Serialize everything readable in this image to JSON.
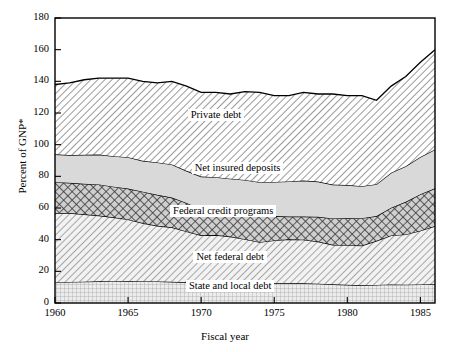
{
  "chart_data": {
    "type": "area",
    "stacked": true,
    "title": "",
    "subtitle": "",
    "xlabel": "Fiscal year",
    "ylabel": "Percent of GNP*",
    "xlim": [
      1960,
      1986
    ],
    "ylim": [
      0,
      180
    ],
    "grid": false,
    "legend_position": "inline-annotations",
    "x_ticks": [
      1960,
      1965,
      1970,
      1975,
      1980,
      1985
    ],
    "y_ticks": [
      0,
      20,
      40,
      60,
      80,
      100,
      120,
      140,
      160,
      180
    ],
    "x": [
      1960,
      1961,
      1962,
      1963,
      1964,
      1965,
      1966,
      1967,
      1968,
      1969,
      1970,
      1971,
      1972,
      1973,
      1974,
      1975,
      1976,
      1977,
      1978,
      1979,
      1980,
      1981,
      1982,
      1983,
      1984,
      1985,
      1986
    ],
    "series": [
      {
        "name": "State and local debt",
        "fill": "fine-grid",
        "values": [
          13.0,
          13.3,
          13.5,
          13.7,
          13.8,
          13.9,
          13.8,
          13.6,
          13.4,
          13.1,
          12.8,
          12.9,
          13.0,
          12.8,
          12.5,
          12.6,
          12.6,
          12.4,
          12.2,
          11.8,
          11.5,
          11.2,
          11.4,
          11.7,
          11.6,
          11.7,
          11.8
        ]
      },
      {
        "name": "Net federal debt",
        "fill": "diagonal-hatch",
        "values": [
          43.8,
          43.5,
          42.5,
          41.5,
          40.3,
          38.9,
          36.7,
          35.2,
          34.4,
          32.1,
          30.0,
          30.0,
          29.0,
          27.5,
          25.9,
          26.9,
          27.6,
          27.6,
          26.6,
          25.0,
          25.0,
          25.1,
          27.9,
          31.0,
          31.7,
          34.0,
          36.8
        ]
      },
      {
        "name": "Federal credit programs",
        "fill": "cross-hatch",
        "values": [
          19.5,
          19.1,
          19.3,
          19.7,
          19.4,
          19.5,
          19.8,
          19.5,
          18.8,
          18.0,
          16.3,
          15.0,
          14.8,
          15.6,
          16.3,
          15.4,
          14.4,
          14.6,
          15.6,
          16.6,
          17.0,
          17.3,
          15.6,
          17.5,
          20.6,
          23.0,
          23.8
        ]
      },
      {
        "name": "Net insured deposits",
        "fill": "light-gray",
        "values": [
          17.6,
          17.5,
          18.3,
          18.9,
          19.2,
          19.8,
          19.5,
          20.5,
          20.9,
          20.3,
          20.8,
          21.6,
          21.7,
          21.8,
          21.6,
          21.6,
          22.2,
          22.7,
          22.3,
          21.4,
          21.0,
          20.2,
          20.1,
          22.1,
          22.5,
          23.5,
          24.6
        ]
      },
      {
        "name": "Private debt",
        "fill": "diagonal-hatch-light",
        "values": [
          44.1,
          45.6,
          47.4,
          48.2,
          49.3,
          49.9,
          50.2,
          50.2,
          52.5,
          53.5,
          53.1,
          53.5,
          53.5,
          55.8,
          56.7,
          54.5,
          54.2,
          55.7,
          55.3,
          57.2,
          56.5,
          57.2,
          53.0,
          54.7,
          56.6,
          59.8,
          63.0
        ]
      }
    ],
    "annotations": [
      {
        "text": "Private debt",
        "x": 1971.0,
        "y": 118.0
      },
      {
        "text": "Net insured deposits",
        "x": 1972.5,
        "y": 84.5
      },
      {
        "text": "Federal credit programs",
        "x": 1971.5,
        "y": 57.5
      },
      {
        "text": "Net federal debt",
        "x": 1972.0,
        "y": 28.5
      },
      {
        "text": "State and local debt",
        "x": 1972.0,
        "y": 10.0
      }
    ]
  }
}
